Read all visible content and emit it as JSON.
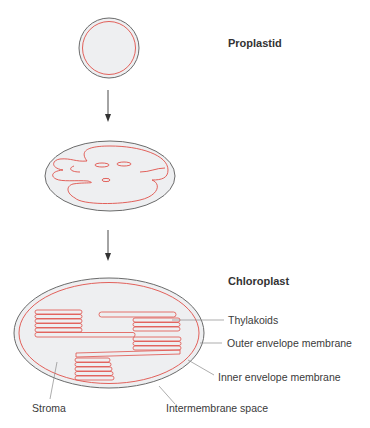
{
  "figure": {
    "stages": [
      {
        "id": "proplastid",
        "title": "Proplastid"
      },
      {
        "id": "intermediate",
        "title": ""
      },
      {
        "id": "chloroplast",
        "title": "Chloroplast"
      }
    ],
    "labels": {
      "thylakoids": "Thylakoids",
      "outer_membrane": "Outer envelope membrane",
      "inner_membrane": "Inner envelope membrane",
      "stroma": "Stroma",
      "intermembrane_space": "Intermembrane space"
    },
    "colors": {
      "outer_membrane": "#6b6b6b",
      "inner_membrane": "#e0504a",
      "stroma_fill": "#eeeff1",
      "leader_lines": "#8a8a8a",
      "arrow": "#333333"
    }
  }
}
